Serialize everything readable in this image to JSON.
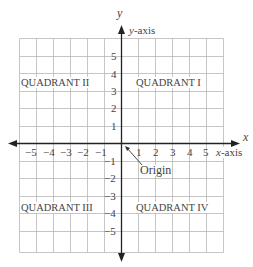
{
  "axes": {
    "x_letter": "x",
    "y_letter": "y",
    "x_axis_label_var": "x",
    "x_axis_label_rest": "-axis",
    "y_axis_label_var": "y",
    "y_axis_label_rest": "-axis"
  },
  "quadrants": {
    "q1": "QUADRANT I",
    "q2": "QUADRANT II",
    "q3": "QUADRANT III",
    "q4": "QUADRANT IV"
  },
  "origin_label": "Origin",
  "x_ticks_negative": [
    "−5",
    "−4",
    "−3",
    "−2",
    "−1"
  ],
  "x_ticks_positive": [
    "1",
    "2",
    "3",
    "4",
    "5"
  ],
  "y_ticks_positive": [
    "5",
    "4",
    "3",
    "2",
    "1"
  ],
  "y_ticks_negative": [
    "−1",
    "−2",
    "−3",
    "−4",
    "−5"
  ],
  "grid": {
    "min": -6,
    "max": 6,
    "cell_px": 17,
    "line_color": "#b8b8b8",
    "axis_color": "#222222"
  }
}
